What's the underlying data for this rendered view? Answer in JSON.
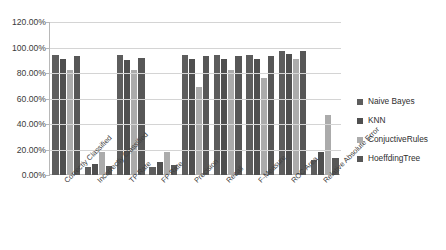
{
  "chart_data": {
    "type": "bar",
    "title": "",
    "xlabel": "",
    "ylabel": "",
    "ylim": [
      0,
      120
    ],
    "grid": true,
    "legend_position": "right",
    "y_ticks": [
      "0.00%",
      "20.00%",
      "40.00%",
      "60.00%",
      "80.00%",
      "100.00%",
      "120.00%"
    ],
    "y_tick_values": [
      0,
      20,
      40,
      60,
      80,
      100,
      120
    ],
    "categories": [
      "Correctly Classified",
      "Incorrectly Classified",
      "TP Rate",
      "FP Rate",
      "Precision",
      "Recall",
      "F-Measure",
      "ROC Area",
      "Relative Absolute Error"
    ],
    "series": [
      {
        "name": "Naive Bayes",
        "color": "#5d5d5d",
        "values": [
          94,
          6,
          94,
          6,
          94,
          94,
          94,
          97,
          12
        ]
      },
      {
        "name": "KNN",
        "color": "#4f4f4f",
        "values": [
          91,
          9,
          90,
          10,
          91,
          91,
          91,
          95,
          18
        ]
      },
      {
        "name": "ConjuctiveRules",
        "color": "#ababab",
        "values": [
          82,
          18,
          82,
          18,
          69,
          82,
          76,
          91,
          47
        ]
      },
      {
        "name": "HoeffdingTree",
        "color": "#575757",
        "values": [
          93,
          7,
          92,
          8,
          93,
          93,
          93,
          97,
          13
        ]
      }
    ]
  },
  "legend": {
    "items": [
      {
        "label": "Naive Bayes",
        "color": "#5d5d5d"
      },
      {
        "label": "KNN",
        "color": "#4f4f4f"
      },
      {
        "label": "ConjuctiveRules",
        "color": "#ababab"
      },
      {
        "label": "HoeffdingTree",
        "color": "#575757"
      }
    ]
  }
}
